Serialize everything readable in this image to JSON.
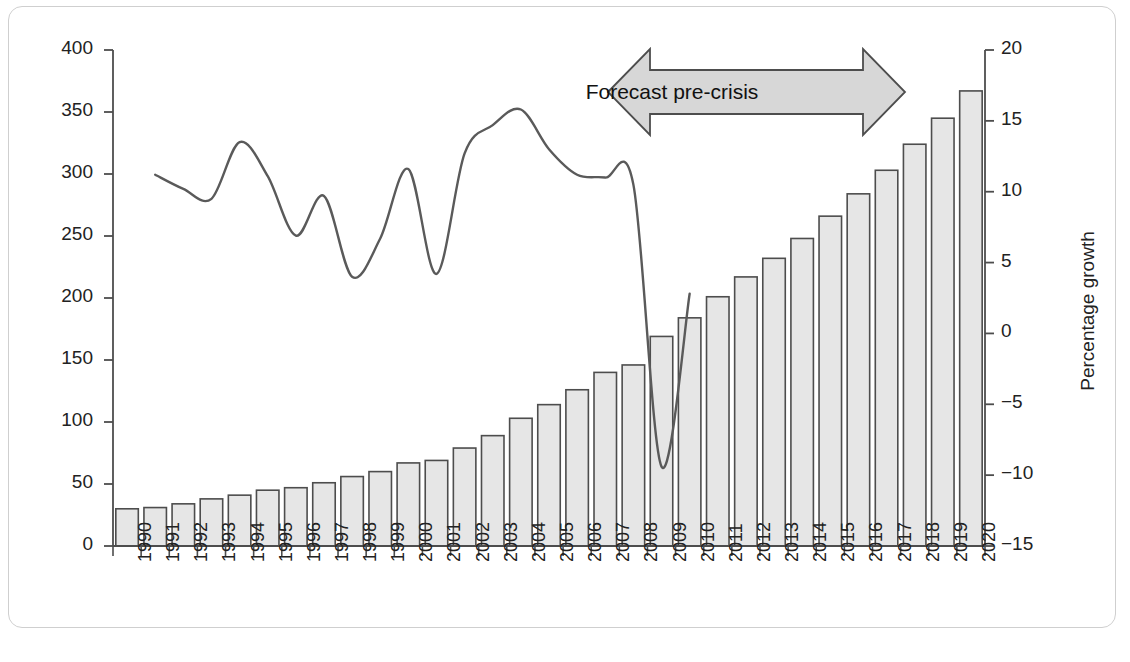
{
  "chart_data": {
    "type": "bar",
    "title": "",
    "subtitle": "",
    "xlabel": "",
    "ylabel": "Million TEUs",
    "y2label": "Percentage growth",
    "ylim": [
      0,
      400
    ],
    "y2lim": [
      -15,
      20
    ],
    "y_ticks": [
      "0",
      "50",
      "100",
      "150",
      "200",
      "250",
      "300",
      "350",
      "400"
    ],
    "y2_ticks": [
      "−15",
      "−10",
      "−5",
      "0",
      "5",
      "10",
      "15",
      "20"
    ],
    "grid": false,
    "legend": "none",
    "categories": [
      "1990",
      "1991",
      "1992",
      "1993",
      "1994",
      "1995",
      "1996",
      "1997",
      "1998",
      "1999",
      "2000",
      "2001",
      "2002",
      "2003",
      "2004",
      "2005",
      "2006",
      "2007",
      "2008",
      "2009",
      "2010",
      "2011",
      "2012",
      "2013",
      "2014",
      "2015",
      "2016",
      "2017",
      "2018",
      "2019",
      "2020"
    ],
    "series": [
      {
        "name": "Million TEUs",
        "type": "bar",
        "axis": "left",
        "values": [
          30,
          31,
          34,
          38,
          41,
          45,
          47,
          51,
          56,
          60,
          67,
          69,
          79,
          89,
          103,
          114,
          126,
          140,
          146,
          169,
          184,
          201,
          217,
          232,
          248,
          266,
          284,
          303,
          324,
          345,
          367
        ]
      },
      {
        "name": "Percentage growth",
        "type": "line",
        "axis": "right",
        "values": [
          null,
          11.2,
          10.2,
          9.5,
          13.5,
          11.1,
          6.9,
          9.7,
          4.0,
          6.7,
          11.6,
          4.2,
          12.7,
          14.7,
          15.8,
          13.0,
          11.2,
          11.0,
          10.5,
          -9.4,
          2.8,
          null,
          null,
          null,
          null,
          null,
          null,
          null,
          null,
          null,
          null
        ]
      }
    ],
    "annotations": [
      {
        "name": "forecast-pre-crisis-arrow",
        "text": "Forecast pre-crisis",
        "shape": "double-headed-arrow",
        "start_category": "2007",
        "end_category": "2016"
      }
    ],
    "colors": {
      "bar_fill": "#e6e6e6",
      "bar_stroke": "#4d4d4d",
      "line_stroke": "#5a5a5a",
      "axis": "#4d4d4d",
      "text": "#222222",
      "arrow_fill": "#d7d7d7",
      "arrow_stroke": "#4d4d4d",
      "frame": "#cfcfcf"
    }
  }
}
